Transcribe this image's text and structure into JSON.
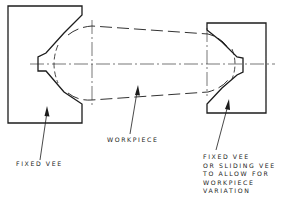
{
  "labels": {
    "fixed_vee": "FIXED VEE",
    "workpiece": "WORKPIECE",
    "right_vee": [
      "FIXED VEE",
      "OR SLIDING VEE",
      "TO ALLOW  FOR",
      "WORKPIECE",
      "VARIATION"
    ]
  },
  "colors": {
    "line": "#1c1c1c",
    "background": "#ffffff"
  }
}
